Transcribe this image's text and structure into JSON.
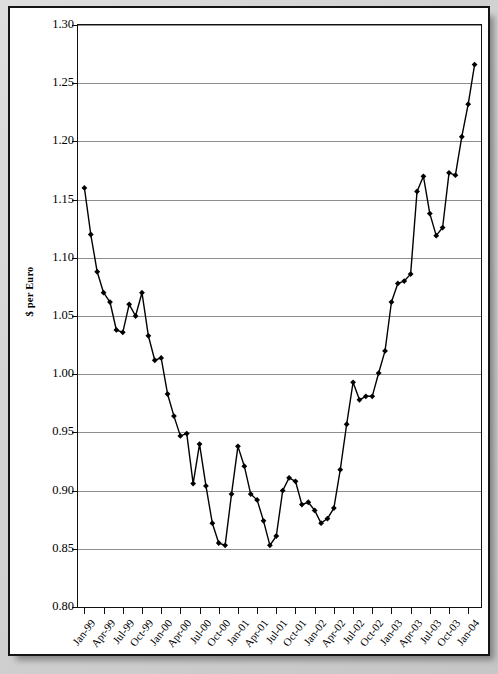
{
  "chart_data": {
    "type": "line",
    "title": "",
    "xlabel": "",
    "ylabel": "$ per Euro",
    "ylim": [
      0.8,
      1.3
    ],
    "ytick_labels": [
      "1.30",
      "1.25",
      "1.20",
      "1.15",
      "1.10",
      "1.05",
      "1.00",
      "0.95",
      "0.90",
      "0.85",
      "0.80"
    ],
    "ytick_values": [
      1.3,
      1.25,
      1.2,
      1.15,
      1.1,
      1.05,
      1.0,
      0.95,
      0.9,
      0.85,
      0.8
    ],
    "grid": true,
    "legend": "none",
    "xtick_labels": [
      "Jan-99",
      "Apr-99",
      "Jul-99",
      "Oct-99",
      "Jan-00",
      "Apr-00",
      "Jul-00",
      "Oct-00",
      "Jan-01",
      "Apr-01",
      "Jul-01",
      "Oct-01",
      "Jan-02",
      "Apr-02",
      "Jul-02",
      "Oct-02",
      "Jan-03",
      "Apr-03",
      "Jul-03",
      "Oct-03",
      "Jan-04"
    ],
    "x_labels_monthly": [
      "Jan-99",
      "Feb-99",
      "Mar-99",
      "Apr-99",
      "May-99",
      "Jun-99",
      "Jul-99",
      "Aug-99",
      "Sep-99",
      "Oct-99",
      "Nov-99",
      "Dec-99",
      "Jan-00",
      "Feb-00",
      "Mar-00",
      "Apr-00",
      "May-00",
      "Jun-00",
      "Jul-00",
      "Aug-00",
      "Sep-00",
      "Oct-00",
      "Nov-00",
      "Dec-00",
      "Jan-01",
      "Feb-01",
      "Mar-01",
      "Apr-01",
      "May-01",
      "Jun-01",
      "Jul-01",
      "Aug-01",
      "Sep-01",
      "Oct-01",
      "Nov-01",
      "Dec-01",
      "Jan-02",
      "Feb-02",
      "Mar-02",
      "Apr-02",
      "May-02",
      "Jun-02",
      "Jul-02",
      "Aug-02",
      "Sep-02",
      "Oct-02",
      "Nov-02",
      "Dec-02",
      "Jan-03",
      "Feb-03",
      "Mar-03",
      "Apr-03",
      "May-03",
      "Jun-03",
      "Jul-03",
      "Aug-03",
      "Sep-03",
      "Oct-03",
      "Nov-03",
      "Dec-03",
      "Jan-04",
      "Feb-04"
    ],
    "values": [
      1.16,
      1.12,
      1.088,
      1.07,
      1.062,
      1.038,
      1.036,
      1.06,
      1.05,
      1.07,
      1.033,
      1.012,
      1.014,
      0.983,
      0.964,
      0.947,
      0.949,
      0.906,
      0.94,
      0.904,
      0.872,
      0.855,
      0.853,
      0.897,
      0.938,
      0.921,
      0.897,
      0.892,
      0.874,
      0.853,
      0.861,
      0.9,
      0.911,
      0.908,
      0.888,
      0.89,
      0.883,
      0.872,
      0.876,
      0.885,
      0.918,
      0.957,
      0.993,
      0.978,
      0.981,
      0.981,
      1.001,
      1.02,
      1.062,
      1.078,
      1.08,
      1.086,
      1.157,
      1.17,
      1.138,
      1.119,
      1.126,
      1.173,
      1.171,
      1.204,
      1.232,
      1.266
    ],
    "series_name": "$ per Euro"
  },
  "axis": {
    "y_title": "$ per Euro"
  }
}
